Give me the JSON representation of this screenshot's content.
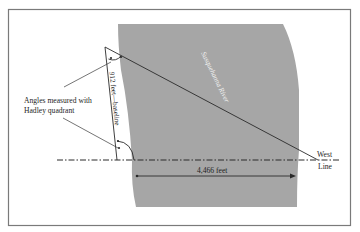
{
  "diagram": {
    "annotation": {
      "line1": "Angles measured with",
      "line2": "Hadley quadrant"
    },
    "baseline_label": "912 feet—baseline",
    "river_label": "Susquehanna River",
    "distance_label": "4,466 feet",
    "west_line_label": {
      "line1": "West",
      "line2": "Line"
    },
    "colors": {
      "background": "#ffffff",
      "frame": "#7a7a7a",
      "river": "#a6a6a6",
      "river_text": "#f2f2f2",
      "lines": "#2a2a2a",
      "text": "#1e1e1e"
    }
  }
}
